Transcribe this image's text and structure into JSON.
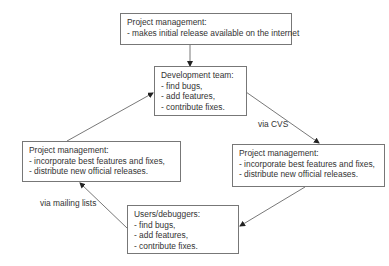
{
  "diagram": {
    "nodes": [
      {
        "id": "pm-initial",
        "title": "Project management:",
        "lines": [
          "- makes initial release available on the internet"
        ]
      },
      {
        "id": "dev-team",
        "title": "Development team:",
        "lines": [
          "- find bugs,",
          "- add features,",
          "- contribute fixes."
        ]
      },
      {
        "id": "pm-left",
        "title": "Project management:",
        "lines": [
          "- incorporate best features and fixes,",
          "- distribute new official releases."
        ]
      },
      {
        "id": "pm-right",
        "title": "Project management:",
        "lines": [
          "- incorporate best features and fixes,",
          "- distribute new official releases."
        ]
      },
      {
        "id": "users",
        "title": "Users/debuggers:",
        "lines": [
          "- find bugs,",
          "- add features,",
          "- contribute fixes."
        ]
      }
    ],
    "edges": [
      {
        "from": "pm-initial",
        "to": "dev-team",
        "label": ""
      },
      {
        "from": "dev-team",
        "to": "pm-right",
        "label": "via CVS"
      },
      {
        "from": "pm-right",
        "to": "users",
        "label": ""
      },
      {
        "from": "users",
        "to": "pm-left",
        "label": "via mailing lists"
      },
      {
        "from": "pm-left",
        "to": "dev-team",
        "label": ""
      }
    ],
    "colors": {
      "border": "#777777",
      "text": "#333333",
      "arrow": "#444444"
    }
  }
}
